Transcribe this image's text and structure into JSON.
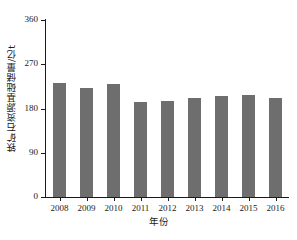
{
  "chart_data": {
    "type": "bar",
    "title": "",
    "xlabel": "年份",
    "ylabel": "铁矿石资源基础储量/亿t",
    "categories": [
      "2008",
      "2009",
      "2010",
      "2011",
      "2012",
      "2013",
      "2014",
      "2015",
      "2016"
    ],
    "values": [
      232,
      222,
      230,
      194,
      196,
      201,
      206,
      207,
      202
    ],
    "ylim": [
      0,
      360
    ],
    "yticks": [
      0,
      90,
      180,
      270,
      360
    ],
    "ytick_labels": [
      "0",
      "90",
      "180",
      "270",
      "360"
    ],
    "grid": false,
    "legend": null,
    "series_color": "#6e6e6e",
    "axis_color": "#1a1a1a",
    "background": "#ffffff"
  }
}
